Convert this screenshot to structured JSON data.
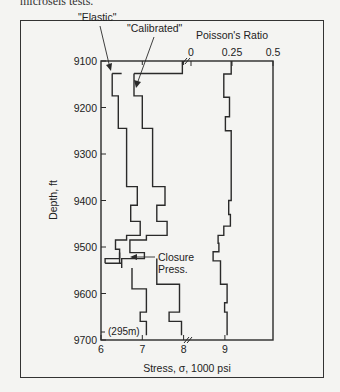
{
  "page": {
    "top_text": "microseis tests."
  },
  "chart_data": {
    "type": "line",
    "title": "",
    "xlabel": "Stress, σ, 1000 psi",
    "x2label": "Poisson's Ratio",
    "ylabel": "Depth, ft",
    "yticks": [
      9100,
      9200,
      9300,
      9400,
      9500,
      9600,
      9700
    ],
    "ylim": [
      9100,
      9700
    ],
    "y_inverted": true,
    "xticks": [
      6,
      7,
      8,
      9
    ],
    "xlim": [
      6,
      10
    ],
    "x_break_at": 8,
    "x2ticks": [
      0,
      0.25,
      0.5
    ],
    "x2lim": [
      0,
      0.5
    ],
    "annotations": [
      {
        "text": "\"Elastic\"",
        "target": "elastic"
      },
      {
        "text": "\"Calibrated\"",
        "target": "calibrated"
      },
      {
        "text": "Closure Press.",
        "target": "closure",
        "line1": "Closure",
        "line2": "Press."
      },
      {
        "text": "(295m)",
        "position": "near bottom of depth axis"
      }
    ],
    "series": [
      {
        "name": "Elastic",
        "axis": "stress",
        "steps": [
          {
            "from": 9127,
            "to": 9175,
            "x": 6.27
          },
          {
            "from": 9175,
            "to": 9245,
            "x": 6.42
          },
          {
            "from": 9245,
            "to": 9370,
            "x": 6.62
          },
          {
            "from": 9370,
            "to": 9410,
            "x": 6.88
          },
          {
            "from": 9410,
            "to": 9445,
            "x": 6.72
          },
          {
            "from": 9445,
            "to": 9475,
            "x": 6.95
          },
          {
            "from": 9475,
            "to": 9485,
            "x": 6.62
          },
          {
            "from": 9485,
            "to": 9505,
            "x": 6.35
          },
          {
            "from": 9505,
            "to": 9525,
            "x": 6.45
          },
          {
            "from": 9525,
            "to": 9535,
            "x": 6.1
          }
        ]
      },
      {
        "name": "Calibrated",
        "axis": "stress",
        "steps": [
          {
            "from": 9127,
            "to": 9175,
            "x": 6.8
          },
          {
            "from": 9175,
            "to": 9245,
            "x": 7.0
          },
          {
            "from": 9245,
            "to": 9370,
            "x": 7.25
          },
          {
            "from": 9370,
            "to": 9410,
            "x": 7.55
          },
          {
            "from": 9410,
            "to": 9445,
            "x": 7.35
          },
          {
            "from": 9445,
            "to": 9475,
            "x": 7.6
          },
          {
            "from": 9475,
            "to": 9485,
            "x": 7.1
          },
          {
            "from": 9485,
            "to": 9512,
            "x": 6.7
          },
          {
            "from": 9512,
            "to": 9525,
            "x": 7.05
          },
          {
            "from": 9525,
            "to": 9545,
            "x": 6.5
          }
        ]
      },
      {
        "name": "Stress (lower)",
        "axis": "stress",
        "steps": [
          {
            "from": 9545,
            "to": 9590,
            "x": 6.75
          },
          {
            "from": 9590,
            "to": 9640,
            "x": 7.1
          },
          {
            "from": 9640,
            "to": 9660,
            "x": 6.95
          },
          {
            "from": 9660,
            "to": 9690,
            "x": 7.1
          }
        ]
      },
      {
        "name": "Calibrated (lower)",
        "axis": "stress",
        "steps": [
          {
            "from": 9525,
            "to": 9580,
            "x": 7.35
          },
          {
            "from": 9580,
            "to": 9640,
            "x": 7.9
          },
          {
            "from": 9640,
            "to": 9660,
            "x": 7.65
          },
          {
            "from": 9660,
            "to": 9690,
            "x": 7.95
          }
        ]
      },
      {
        "name": "Poisson's Ratio",
        "axis": "poisson",
        "steps": [
          {
            "from": 9100,
            "to": 9128,
            "x": 0.245
          },
          {
            "from": 9128,
            "to": 9178,
            "x": 0.2
          },
          {
            "from": 9178,
            "to": 9220,
            "x": 0.235
          },
          {
            "from": 9220,
            "to": 9250,
            "x": 0.21
          },
          {
            "from": 9250,
            "to": 9400,
            "x": 0.245
          },
          {
            "from": 9400,
            "to": 9430,
            "x": 0.23
          },
          {
            "from": 9430,
            "to": 9455,
            "x": 0.24
          },
          {
            "from": 9455,
            "to": 9475,
            "x": 0.2
          },
          {
            "from": 9475,
            "to": 9492,
            "x": 0.165
          },
          {
            "from": 9492,
            "to": 9510,
            "x": 0.17
          },
          {
            "from": 9510,
            "to": 9530,
            "x": 0.135
          },
          {
            "from": 9530,
            "to": 9580,
            "x": 0.18
          },
          {
            "from": 9580,
            "to": 9620,
            "x": 0.22
          },
          {
            "from": 9620,
            "to": 9640,
            "x": 0.205
          },
          {
            "from": 9640,
            "to": 9690,
            "x": 0.22
          }
        ]
      }
    ],
    "grid": false,
    "legend": "none (inline annotations)"
  }
}
